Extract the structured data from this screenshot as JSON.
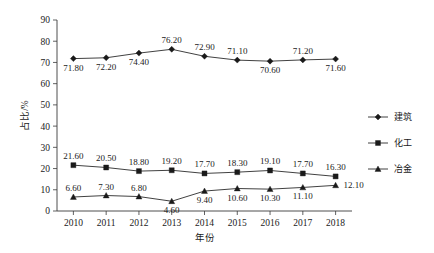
{
  "chart_data": {
    "type": "line",
    "title": "",
    "xlabel": "年份",
    "ylabel": "占比/%",
    "categories": [
      "2010",
      "2011",
      "2012",
      "2013",
      "2014",
      "2015",
      "2016",
      "2017",
      "2018"
    ],
    "ylim": [
      0,
      90
    ],
    "ytick_step": 10,
    "yticks": [
      "0",
      "10",
      "20",
      "30",
      "40",
      "50",
      "60",
      "70",
      "80",
      "90"
    ],
    "grid": false,
    "legend_position": "right",
    "series": [
      {
        "name": "建筑",
        "marker": "diamond",
        "color": "#1a1a1a",
        "values": [
          71.8,
          72.2,
          74.4,
          76.2,
          72.9,
          71.1,
          70.6,
          71.2,
          71.6
        ],
        "labels": [
          "71.80",
          "72.20",
          "74.40",
          "76.20",
          "72.90",
          "71.10",
          "70.60",
          "71.20",
          "71.60"
        ],
        "label_positions": [
          "below",
          "below",
          "below",
          "above",
          "above",
          "above",
          "below",
          "above",
          "below"
        ]
      },
      {
        "name": "化工",
        "marker": "square",
        "color": "#1a1a1a",
        "values": [
          21.6,
          20.5,
          18.8,
          19.2,
          17.7,
          18.3,
          19.1,
          17.7,
          16.3
        ],
        "labels": [
          "21.60",
          "20.50",
          "18.80",
          "19.20",
          "17.70",
          "18.30",
          "19.10",
          "17.70",
          "16.30"
        ],
        "label_positions": [
          "above",
          "above",
          "above",
          "above",
          "above",
          "above",
          "above",
          "above",
          "above"
        ]
      },
      {
        "name": "冶金",
        "marker": "triangle",
        "color": "#1a1a1a",
        "values": [
          6.6,
          7.3,
          6.8,
          4.6,
          9.4,
          10.6,
          10.3,
          11.1,
          12.1
        ],
        "labels": [
          "6.60",
          "7.30",
          "6.80",
          "4.60",
          "9.40",
          "10.60",
          "10.30",
          "11.10",
          "12.10"
        ],
        "label_positions": [
          "above",
          "above",
          "above",
          "below",
          "below",
          "below",
          "below",
          "below",
          "right"
        ]
      }
    ]
  },
  "legend": {
    "items": [
      {
        "label": "建筑",
        "marker": "diamond"
      },
      {
        "label": "化工",
        "marker": "square"
      },
      {
        "label": "冶金",
        "marker": "triangle"
      }
    ]
  }
}
